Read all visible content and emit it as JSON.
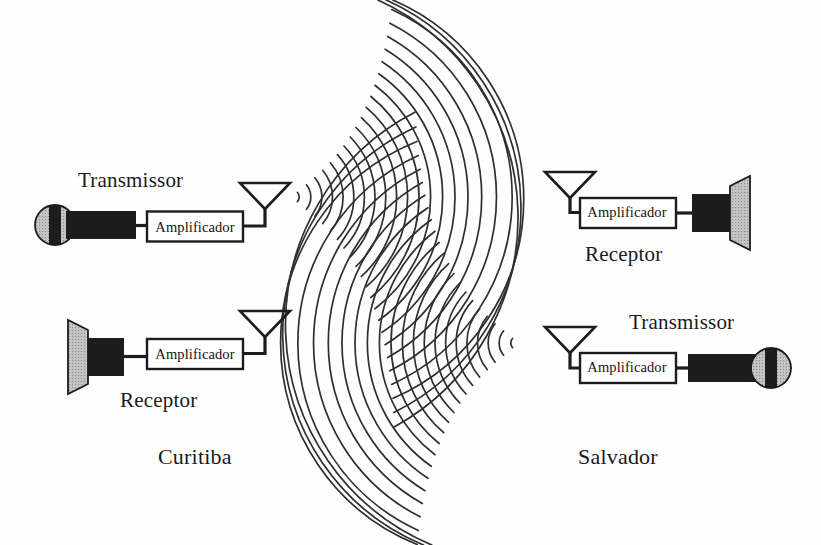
{
  "figure": {
    "background_color": "#fefefe",
    "line_color": "#2b2b2b",
    "fill_dark": "#1c1c1c",
    "fill_gray": "#b9b9b9"
  },
  "stations": [
    {
      "id": "curitiba-transmitter",
      "city": "Curitiba",
      "role_label": "Transmissor",
      "amplifier_label": "Amplificador",
      "components": [
        "microphone",
        "amplifier",
        "antenna"
      ],
      "position": "top-left"
    },
    {
      "id": "curitiba-receiver",
      "city": "Curitiba",
      "role_label": "Receptor",
      "amplifier_label": "Amplificador",
      "components": [
        "speaker",
        "amplifier",
        "antenna"
      ],
      "position": "bottom-left"
    },
    {
      "id": "salvador-receiver",
      "city": "Salvador",
      "role_label": "Receptor",
      "amplifier_label": "Amplificador",
      "components": [
        "antenna",
        "amplifier",
        "speaker"
      ],
      "position": "top-right"
    },
    {
      "id": "salvador-transmitter",
      "city": "Salvador",
      "role_label": "Transmissor",
      "amplifier_label": "Amplificador",
      "components": [
        "antenna",
        "amplifier",
        "microphone"
      ],
      "position": "bottom-right"
    }
  ],
  "cities": {
    "left": "Curitiba",
    "right": "Salvador"
  },
  "labels": {
    "transmitter_left": "Transmissor",
    "receiver_left": "Receptor",
    "receiver_right": "Receptor",
    "transmitter_right": "Transmissor",
    "amplifier_1": "Amplificador",
    "amplifier_2": "Amplificador",
    "amplifier_3": "Amplificador",
    "amplifier_4": "Amplificador"
  },
  "waves": {
    "left_source": {
      "cx": 292,
      "cy": 197,
      "arc_count": 22,
      "spacing": 11.5,
      "direction": "rightward"
    },
    "right_source": {
      "cx": 518,
      "cy": 343,
      "arc_count": 22,
      "spacing": 11.5,
      "direction": "leftward"
    }
  }
}
